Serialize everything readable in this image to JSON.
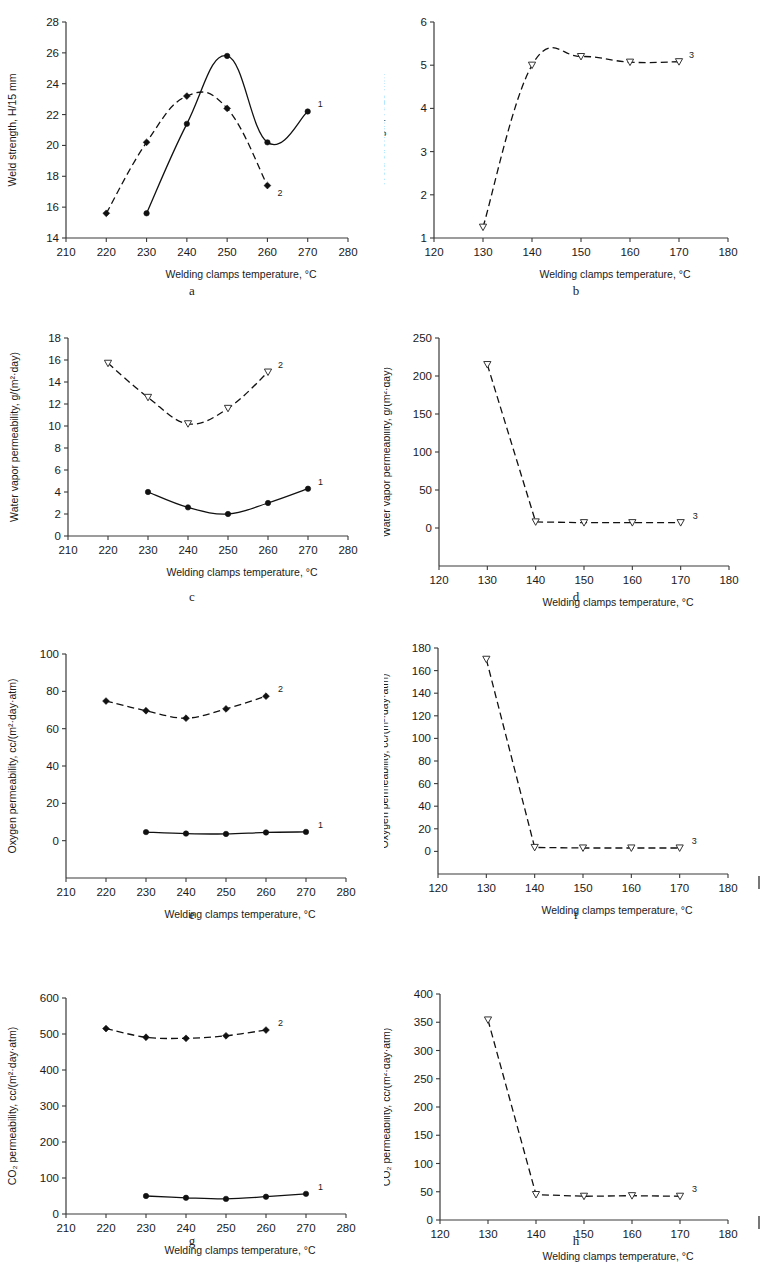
{
  "figure": {
    "xlabel_common": "Welding clamps temperature, °C",
    "panel_letters": [
      "a",
      "b",
      "c",
      "d",
      "e",
      "f",
      "g",
      "h"
    ]
  },
  "axis_titles": {
    "weld_strength": "Weld strength, H/15 mm",
    "water_vapor": "Water vapor permeability, g/(m²·day)",
    "oxygen": "Oxygen permeability, cc/(m²·day·atm)",
    "co2": "CO₂ permeability, cc/(m²·day·atm)"
  },
  "series_labels": {
    "one": "1",
    "two": "2",
    "three": "3"
  },
  "chart_data": [
    {
      "id": "a",
      "panel": "a",
      "type": "line",
      "title": "",
      "xlabel": "Welding clamps temperature, °C",
      "ylabel": "Weld strength, H/15 mm",
      "xlim": [
        210,
        280
      ],
      "ylim": [
        14,
        28
      ],
      "xticks": [
        210,
        220,
        230,
        240,
        250,
        260,
        270,
        280
      ],
      "yticks": [
        14,
        16,
        18,
        20,
        22,
        24,
        26,
        28
      ],
      "grid": false,
      "legend": "inline-right",
      "series": [
        {
          "name": "1",
          "style": "solid",
          "marker": "filled-circle",
          "x": [
            230,
            240,
            250,
            260,
            270
          ],
          "values": [
            15.6,
            21.4,
            25.8,
            20.2,
            22.2
          ]
        },
        {
          "name": "2",
          "style": "dashed",
          "marker": "filled-diamond",
          "x": [
            220,
            230,
            240,
            250,
            260
          ],
          "values": [
            15.6,
            20.2,
            23.2,
            22.4,
            17.4
          ]
        }
      ]
    },
    {
      "id": "b",
      "panel": "b",
      "type": "line",
      "title": "",
      "xlabel": "Welding clamps temperature, °C",
      "ylabel": "Weld strength, H/15 mm",
      "xlim": [
        120,
        180
      ],
      "ylim": [
        1,
        6
      ],
      "xticks": [
        120,
        130,
        140,
        150,
        160,
        170,
        180
      ],
      "yticks": [
        1,
        2,
        3,
        4,
        5,
        6
      ],
      "grid": false,
      "legend": "inline-right",
      "series": [
        {
          "name": "3",
          "style": "dashed",
          "marker": "open-triangle-down",
          "x": [
            130,
            140,
            150,
            160,
            170
          ],
          "values": [
            1.25,
            5.0,
            5.2,
            5.07,
            5.08
          ]
        }
      ]
    },
    {
      "id": "c",
      "panel": "c",
      "type": "line",
      "title": "",
      "xlabel": "Welding clamps temperature, °C",
      "ylabel": "Water vapor permeability, g/(m²·day)",
      "xlim": [
        210,
        280
      ],
      "ylim": [
        0,
        18
      ],
      "xticks": [
        210,
        220,
        230,
        240,
        250,
        260,
        270,
        280
      ],
      "yticks": [
        0,
        2,
        4,
        6,
        8,
        10,
        12,
        14,
        16,
        18
      ],
      "grid": false,
      "legend": "inline-right",
      "series": [
        {
          "name": "1",
          "style": "solid",
          "marker": "filled-circle",
          "x": [
            230,
            240,
            250,
            260,
            270
          ],
          "values": [
            4.0,
            2.6,
            2.0,
            3.0,
            4.3
          ]
        },
        {
          "name": "2",
          "style": "dashed",
          "marker": "open-triangle-down",
          "x": [
            220,
            230,
            240,
            250,
            260
          ],
          "values": [
            15.7,
            12.6,
            10.2,
            11.6,
            14.9
          ]
        }
      ]
    },
    {
      "id": "d",
      "panel": "d",
      "type": "line",
      "title": "",
      "xlabel": "Welding clamps temperature, °C",
      "ylabel": "Water vapor permeability, g/(m²·day)",
      "xlim": [
        120,
        180
      ],
      "ylim": [
        -50,
        250
      ],
      "xticks": [
        120,
        130,
        140,
        150,
        160,
        170,
        180
      ],
      "yticks": [
        0,
        50,
        100,
        150,
        200,
        250
      ],
      "grid": false,
      "legend": "inline-right",
      "series": [
        {
          "name": "3",
          "style": "dashed",
          "marker": "open-triangle-down",
          "x": [
            130,
            140,
            150,
            160,
            170
          ],
          "values": [
            215,
            8,
            7,
            7,
            7
          ]
        }
      ]
    },
    {
      "id": "e",
      "panel": "e",
      "type": "line",
      "title": "",
      "xlabel": "Welding clamps temperature, °C",
      "ylabel": "Oxygen permeability, cc/(m²·day·atm)",
      "xlim": [
        210,
        280
      ],
      "ylim": [
        -20,
        100
      ],
      "xticks": [
        210,
        220,
        230,
        240,
        250,
        260,
        270,
        280
      ],
      "yticks": [
        0,
        20,
        40,
        60,
        80,
        100
      ],
      "grid": false,
      "legend": "inline-right",
      "series": [
        {
          "name": "1",
          "style": "solid",
          "marker": "filled-circle",
          "x": [
            230,
            240,
            250,
            260,
            270
          ],
          "values": [
            4.6,
            3.8,
            3.6,
            4.4,
            4.7
          ]
        },
        {
          "name": "2",
          "style": "dashed",
          "marker": "filled-diamond",
          "x": [
            220,
            230,
            240,
            250,
            260
          ],
          "values": [
            74.8,
            69.6,
            65.6,
            70.6,
            77.4
          ]
        }
      ]
    },
    {
      "id": "f",
      "panel": "f",
      "type": "line",
      "title": "",
      "xlabel": "Welding clamps temperature, °C",
      "ylabel": "Oxygen permeability, cc/(m²·day·atm)",
      "xlim": [
        120,
        180
      ],
      "ylim": [
        -20,
        180
      ],
      "xticks": [
        120,
        130,
        140,
        150,
        160,
        170,
        180
      ],
      "yticks": [
        0,
        20,
        40,
        60,
        80,
        100,
        120,
        140,
        160,
        180
      ],
      "grid": false,
      "legend": "inline-right",
      "series": [
        {
          "name": "3",
          "style": "dashed",
          "marker": "open-triangle-down",
          "x": [
            130,
            140,
            150,
            160,
            170
          ],
          "values": [
            170,
            3.5,
            3,
            3,
            3
          ]
        }
      ]
    },
    {
      "id": "g",
      "panel": "g",
      "type": "line",
      "title": "",
      "xlabel": "Welding clamps temperature, °C",
      "ylabel": "CO₂ permeability, cc/(m²·day·atm)",
      "xlim": [
        210,
        280
      ],
      "ylim": [
        0,
        600
      ],
      "xticks": [
        210,
        220,
        230,
        240,
        250,
        260,
        270,
        280
      ],
      "yticks": [
        0,
        100,
        200,
        300,
        400,
        500,
        600
      ],
      "grid": false,
      "legend": "inline-right",
      "series": [
        {
          "name": "1",
          "style": "solid",
          "marker": "filled-circle",
          "x": [
            230,
            240,
            250,
            260,
            270
          ],
          "values": [
            50,
            45,
            42,
            48,
            56
          ]
        },
        {
          "name": "2",
          "style": "dashed",
          "marker": "filled-diamond",
          "x": [
            220,
            230,
            240,
            250,
            260
          ],
          "values": [
            515,
            491,
            488,
            495,
            511
          ]
        }
      ]
    },
    {
      "id": "h",
      "panel": "h",
      "type": "line",
      "title": "",
      "xlabel": "Welding clamps temperature, °C",
      "ylabel": "CO₂ permeability, cc/(m²·day·atm)",
      "xlim": [
        120,
        180
      ],
      "ylim": [
        0,
        400
      ],
      "xticks": [
        120,
        130,
        140,
        150,
        160,
        170,
        180
      ],
      "yticks": [
        0,
        50,
        100,
        150,
        200,
        250,
        300,
        350,
        400
      ],
      "grid": false,
      "legend": "inline-right",
      "series": [
        {
          "name": "3",
          "style": "dashed",
          "marker": "open-triangle-down",
          "x": [
            130,
            140,
            150,
            160,
            170
          ],
          "values": [
            354,
            45,
            42,
            43,
            42
          ]
        }
      ]
    }
  ]
}
